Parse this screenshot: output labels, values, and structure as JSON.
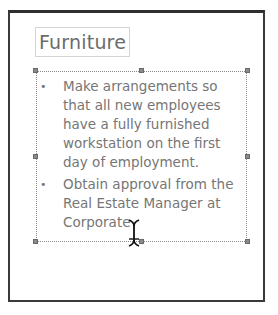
{
  "slide": {
    "title": "Furniture",
    "bullets": [
      {
        "marker": "•",
        "text": "Make arrangements so that all new employees have a fully furnished workstation on the first day of employment."
      },
      {
        "marker": "•",
        "text": "Obtain approval from the Real Estate Manager at Corporate"
      }
    ]
  },
  "cursor": {
    "type": "i-beam"
  }
}
